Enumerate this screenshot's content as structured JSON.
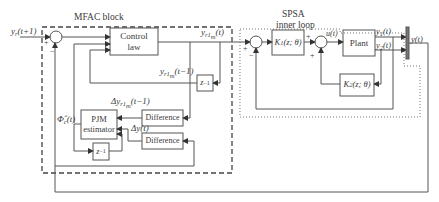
{
  "diagram": {
    "regions": {
      "mfac_title": "MFAC block",
      "spsa_title": "SPSA",
      "spsa_subtitle": "inner loop"
    },
    "blocks": {
      "control_law_1": "Control",
      "control_law_2": "law",
      "delay_top": "z",
      "delay_top_exp": "−1",
      "difference_1": "Difference",
      "difference_2": "Difference",
      "pjm_1": "PJM",
      "pjm_2": "estimator",
      "delay_bottom": "z",
      "delay_bottom_exp": "−1",
      "k1": "K",
      "k1_sub": "1",
      "k1_args": "(z; θ)",
      "k2": "K",
      "k2_sub": "2",
      "k2_args": "(z; θ)",
      "plant": "Plant"
    },
    "signals": {
      "yr_main": "y",
      "yr_sub": "r",
      "yr_args": "(t+1)",
      "yr1m_t_main": "y",
      "yr1m_t_sub": "r1",
      "yr1m_t_subsub": "m",
      "yr1m_t_args": "(t)",
      "yr1m_tm1_main": "y",
      "yr1m_tm1_sub": "r1",
      "yr1m_tm1_subsub": "m",
      "yr1m_tm1_args": "(t−1)",
      "dyr1m_prefix": "Δy",
      "dyr1m_sub": "r1",
      "dyr1m_subsub": "m",
      "dyr1m_args": "(t−1)",
      "dy": "Δy(t)",
      "phi_main": "Φ̂",
      "phi_sub": "c",
      "phi_args": "(t)",
      "u": "u(t)",
      "y1_main": "y",
      "y1_sub": "1",
      "y1_args": "(t)",
      "y2_main": "y",
      "y2_sub": "2",
      "y2_args": "(t)",
      "y_out": "y(t)"
    },
    "signs": {
      "s1_plus": "+",
      "s1_minus": "−",
      "s2_plus": "+",
      "s2_minus": "−",
      "s3_plus_top": "+",
      "s3_plus_bottom": "+"
    },
    "colors": {
      "line": "#555555",
      "text": "#3a3a3a",
      "background": "#ffffff"
    }
  }
}
